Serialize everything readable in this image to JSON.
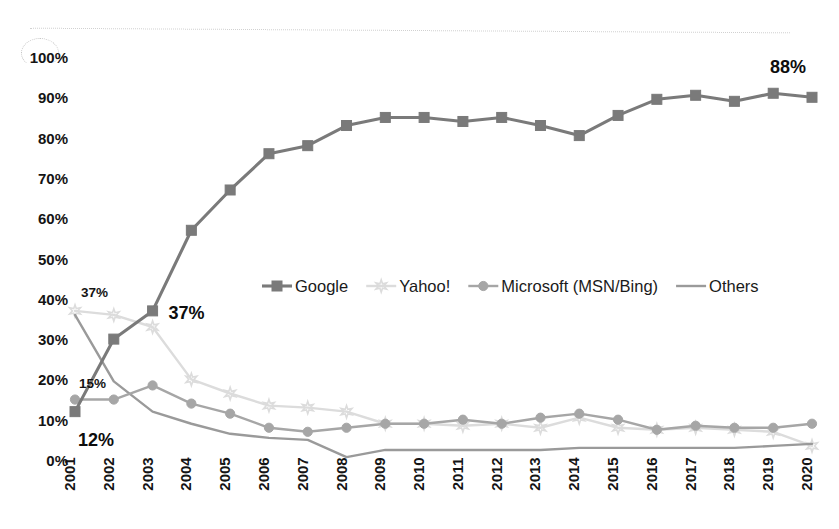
{
  "chart_data": {
    "type": "line",
    "title": "",
    "xlabel": "",
    "ylabel": "",
    "ylim": [
      0,
      100
    ],
    "ytick_labels": [
      "100%",
      "90%",
      "80%",
      "70%",
      "60%",
      "50%",
      "40%",
      "30%",
      "20%",
      "10%",
      "0%"
    ],
    "ytick_values": [
      100,
      90,
      80,
      70,
      60,
      50,
      40,
      30,
      20,
      10,
      0
    ],
    "grid": false,
    "legend_position": "center",
    "categories": [
      "2001",
      "2002",
      "2003",
      "2004",
      "2005",
      "2006",
      "2007",
      "2008",
      "2009",
      "2010",
      "2011",
      "2012",
      "2013",
      "2014",
      "2015",
      "2016",
      "2017",
      "2018",
      "2019",
      "2020"
    ],
    "series": [
      {
        "name": "Google",
        "color": "#7a7a7a",
        "marker": "square",
        "values": [
          12,
          30,
          37,
          57,
          67,
          76,
          78,
          83,
          85,
          85,
          84,
          85,
          83,
          80.5,
          85.5,
          89.5,
          90.5,
          89,
          91,
          90
        ]
      },
      {
        "name": "Yahoo!",
        "color": "#dcdcdc",
        "marker": "star",
        "values": [
          37,
          36,
          33,
          20,
          16.5,
          13.5,
          13,
          12,
          9,
          9,
          8.5,
          9,
          8,
          10.5,
          8,
          7.5,
          8,
          7.5,
          7,
          3.5
        ]
      },
      {
        "name": "Microsoft (MSN/Bing)",
        "color": "#a6a6a6",
        "marker": "circle",
        "values": [
          15,
          15,
          18.5,
          14,
          11.5,
          8,
          7,
          8,
          9,
          9,
          10,
          9,
          10.5,
          11.5,
          10,
          7.5,
          8.5,
          8,
          8,
          9
        ]
      },
      {
        "name": "Others",
        "color": "#9a9a9a",
        "marker": "none",
        "values": [
          36,
          19.5,
          12,
          9,
          6.5,
          5.5,
          5,
          0.7,
          2.5,
          2.5,
          2.5,
          2.5,
          2.5,
          3,
          3,
          3,
          3,
          3,
          3.5,
          4
        ]
      }
    ],
    "annotations": [
      {
        "text": "37%",
        "series": "Yahoo!",
        "x": "2001",
        "style": "small"
      },
      {
        "text": "15%",
        "series": "Microsoft (MSN/Bing)",
        "x": "2001",
        "style": "small"
      },
      {
        "text": "12%",
        "series": "Google",
        "x": "2001",
        "style": "bold"
      },
      {
        "text": "37%",
        "series": "Google",
        "x": "2003",
        "style": "bold"
      },
      {
        "text": "88%",
        "series": "Google",
        "x": "2020",
        "style": "bold"
      }
    ]
  }
}
